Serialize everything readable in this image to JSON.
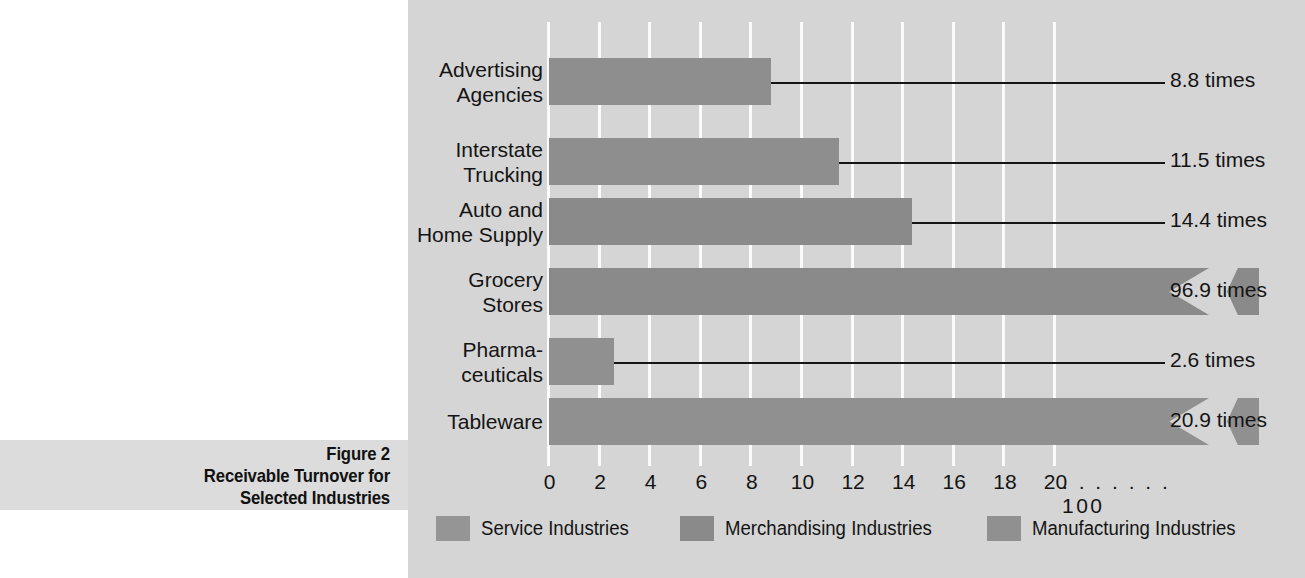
{
  "caption": {
    "lines": [
      "Figure 2",
      "Receivable Turnover for",
      "Selected Industries"
    ]
  },
  "chart_data": {
    "type": "bar",
    "orientation": "horizontal",
    "title": "Receivable Turnover for Selected Industries",
    "figure_number": "Figure 2",
    "xlabel": "",
    "ylabel": "",
    "xlim": [
      0,
      20
    ],
    "grid": true,
    "legend_position": "bottom",
    "axis_break": {
      "present": true,
      "after_tick": "20",
      "dots": ". . . . . . .",
      "resume_tick": "100"
    },
    "tick_labels": [
      "0",
      "2",
      "4",
      "6",
      "8",
      "10",
      "12",
      "14",
      "16",
      "18",
      "20",
      ". . . . . . . 100"
    ],
    "tick_values": [
      0,
      2,
      4,
      6,
      8,
      10,
      12,
      14,
      16,
      18,
      20
    ],
    "categories": [
      "Advertising Agencies",
      "Interstate Trucking",
      "Auto and Home Supply",
      "Grocery Stores",
      "Pharmaceuticals",
      "Tableware"
    ],
    "category_label_lines": [
      [
        "Advertising",
        "Agencies"
      ],
      [
        "Interstate",
        "Trucking"
      ],
      [
        "Auto and",
        "Home Supply"
      ],
      [
        "Grocery",
        "Stores"
      ],
      [
        "Pharma-",
        "ceuticals"
      ],
      [
        "Tableware"
      ]
    ],
    "values": [
      8.8,
      11.5,
      14.4,
      96.9,
      2.6,
      20.9
    ],
    "value_labels": [
      "8.8 times",
      "11.5 times",
      "14.4 times",
      "96.9 times",
      "2.6 times",
      "20.9 times"
    ],
    "series_of_category": [
      "Service Industries",
      "Service Industries",
      "Merchandising Industries",
      "Merchandising Industries",
      "Manufacturing Industries",
      "Manufacturing Industries"
    ],
    "legend": [
      {
        "label": "Service Industries",
        "color": "#959595"
      },
      {
        "label": "Merchandising Industries",
        "color": "#8a8a8a"
      },
      {
        "label": "Manufacturing Industries",
        "color": "#909090"
      }
    ],
    "colors": {
      "panel_background": "#d5d5d5",
      "gridline": "#fbfbfb",
      "bar_service": "#959595",
      "bar_merchandising": "#8a8a8a",
      "bar_manufacturing": "#909090",
      "text": "#141414",
      "caption_band": "#dcdcdc",
      "leader_line": "#151515"
    }
  }
}
